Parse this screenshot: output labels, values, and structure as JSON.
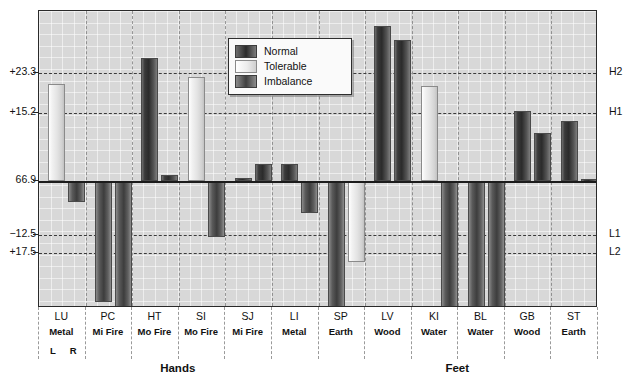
{
  "chart_data": {
    "type": "bar",
    "title": "",
    "xlabel": "",
    "ylabel": "",
    "orientation": "vertical",
    "grid": true,
    "legend_position": "top-center-inset",
    "baseline_value": "66.9",
    "y_axis_left_ticks": [
      "+23.3",
      "+15.2",
      "66.9",
      "−12.5",
      "+17.5"
    ],
    "y_axis_right_ticks": [
      "H2",
      "H1",
      "L1",
      "L2"
    ],
    "categories": [
      "LU",
      "PC",
      "HT",
      "SI",
      "SJ",
      "LI",
      "SP",
      "LV",
      "KI",
      "BL",
      "GB",
      "ST"
    ],
    "category_elements": [
      "Metal",
      "Mi Fire",
      "Mo Fire",
      "Mo Fire",
      "Mi Fire",
      "Metal",
      "Earth",
      "Wood",
      "Water",
      "Water",
      "Wood",
      "Earth"
    ],
    "side_labels": [
      "L",
      "R"
    ],
    "group_labels": [
      "Hands",
      "Feet"
    ],
    "series": [
      {
        "name": "Normal",
        "color": "#2b2b2b"
      },
      {
        "name": "Tolerable",
        "color": "#ececec"
      },
      {
        "name": "Imbalance",
        "color": "#3f3f3f"
      }
    ],
    "bars": [
      {
        "category": "LU",
        "side": "L",
        "series": "Tolerable",
        "value": 21.0
      },
      {
        "category": "LU",
        "side": "R",
        "series": "Imbalance",
        "value": -4.6
      },
      {
        "category": "PC",
        "side": "L",
        "series": "Imbalance",
        "value": -26.0
      },
      {
        "category": "PC",
        "side": "R",
        "series": "Imbalance",
        "value": -33.5
      },
      {
        "category": "HT",
        "side": "L",
        "series": "Normal",
        "value": 26.5
      },
      {
        "category": "HT",
        "side": "R",
        "series": "Normal",
        "value": 1.4
      },
      {
        "category": "SI",
        "side": "L",
        "series": "Tolerable",
        "value": 22.4
      },
      {
        "category": "SI",
        "side": "R",
        "series": "Imbalance",
        "value": -12.0
      },
      {
        "category": "SJ",
        "side": "L",
        "series": "Normal",
        "value": 0.7
      },
      {
        "category": "SJ",
        "side": "R",
        "series": "Normal",
        "value": 3.6
      },
      {
        "category": "LI",
        "side": "L",
        "series": "Normal",
        "value": 3.6
      },
      {
        "category": "LI",
        "side": "R",
        "series": "Imbalance",
        "value": -6.8
      },
      {
        "category": "SP",
        "side": "L",
        "series": "Imbalance",
        "value": -41.0
      },
      {
        "category": "SP",
        "side": "R",
        "series": "Tolerable",
        "value": -17.5
      },
      {
        "category": "LV",
        "side": "L",
        "series": "Normal",
        "value": 33.5
      },
      {
        "category": "LV",
        "side": "R",
        "series": "Normal",
        "value": 30.5
      },
      {
        "category": "KI",
        "side": "L",
        "series": "Tolerable",
        "value": 20.5
      },
      {
        "category": "KI",
        "side": "R",
        "series": "Imbalance",
        "value": -41.0
      },
      {
        "category": "BL",
        "side": "L",
        "series": "Imbalance",
        "value": -40.0
      },
      {
        "category": "BL",
        "side": "R",
        "series": "Imbalance",
        "value": -41.0
      },
      {
        "category": "GB",
        "side": "L",
        "series": "Normal",
        "value": 15.2
      },
      {
        "category": "GB",
        "side": "R",
        "series": "Normal",
        "value": 10.4
      },
      {
        "category": "ST",
        "side": "L",
        "series": "Normal",
        "value": 12.9
      },
      {
        "category": "ST",
        "side": "R",
        "series": "Normal",
        "value": 0.4
      }
    ]
  },
  "legend": {
    "items": [
      {
        "label": "Normal",
        "swatch": "normal"
      },
      {
        "label": "Tolerable",
        "swatch": "tolerable"
      },
      {
        "label": "Imbalance",
        "swatch": "imbalance"
      }
    ]
  },
  "axis": {
    "left": [
      {
        "label": "+23.3",
        "y": 72
      },
      {
        "label": "+15.2",
        "y": 112
      },
      {
        "label": "66.9",
        "y": 180
      },
      {
        "label": "−12.5",
        "y": 234
      },
      {
        "label": "+17.5",
        "y": 252
      }
    ],
    "right": [
      {
        "label": "H2",
        "y": 72
      },
      {
        "label": "H1",
        "y": 112
      },
      {
        "label": "L1",
        "y": 234
      },
      {
        "label": "L2",
        "y": 252
      }
    ]
  },
  "footer": {
    "hands": "Hands",
    "feet": "Feet",
    "left_side": "L",
    "right_side": "R"
  }
}
